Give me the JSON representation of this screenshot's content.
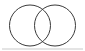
{
  "figure": {
    "name": "venn-diagram",
    "type": "two-set-venn",
    "width": 85,
    "height": 51,
    "background_color": "#ffffff"
  },
  "style": {
    "stroke_color": "#3a3a3a",
    "stroke_width": 1,
    "fill": "none",
    "rule_color": "#c9c9c9"
  },
  "circles": [
    {
      "name": "left-circle",
      "label": "",
      "cx": 30,
      "cy": 25.5,
      "r": 20.5
    },
    {
      "name": "right-circle",
      "label": "",
      "cx": 55,
      "cy": 25.5,
      "r": 20.5
    }
  ],
  "baseline": {
    "name": "bottom-rule",
    "x1": 2,
    "x2": 83,
    "y": 49,
    "visible": true
  },
  "labels": {
    "left_set": "",
    "right_set": "",
    "intersection": "",
    "caption": ""
  }
}
